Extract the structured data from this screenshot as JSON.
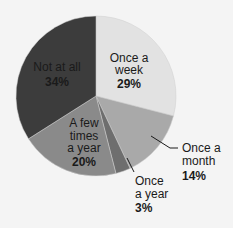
{
  "chart_data": {
    "type": "pie",
    "title": "",
    "slices": [
      {
        "label": "Once a week",
        "value": 29,
        "color": "#e2e2e2"
      },
      {
        "label": "Once a month",
        "value": 14,
        "color": "#a9a9a9"
      },
      {
        "label": "Once a year",
        "value": 3,
        "color": "#6e6e6e"
      },
      {
        "label": "A few times a year",
        "value": 20,
        "color": "#8a8a8a"
      },
      {
        "label": "Not at all",
        "value": 34,
        "color": "#3c3c3c"
      }
    ],
    "start_angle_deg": 0,
    "direction": "clockwise",
    "legend": "none (inline labels)"
  },
  "labels": {
    "week": {
      "line1": "Once a",
      "line2": "week",
      "pct": "29%"
    },
    "month": {
      "line1": "Once a",
      "line2": "month",
      "pct": "14%"
    },
    "year": {
      "line1": "Once",
      "line2": "a year",
      "pct": "3%"
    },
    "few": {
      "line1": "A few",
      "line2": "times",
      "line3": "a year",
      "pct": "20%"
    },
    "notatall": {
      "line1": "Not at all",
      "pct": "34%"
    }
  }
}
